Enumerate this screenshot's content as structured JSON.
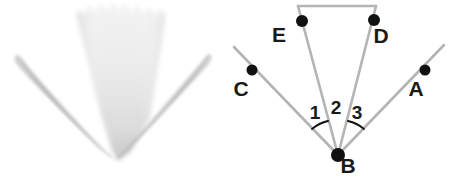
{
  "figure": {
    "background_color": "#ffffff",
    "width": 449,
    "height": 185
  },
  "photo_panel": {
    "name": "blurred-plant-photograph",
    "description": "Out-of-focus grayscale photograph of a pale cone-shaped leaf flanked by two narrow tapered leaves converging at a single point",
    "colors": {
      "cone_light": "#f2f2f2",
      "cone_mid": "#e0e0e0",
      "cone_dark": "#c9c9c9",
      "blade_light": "#d8d8d8",
      "blade_mid": "#bdbdbd",
      "blade_dark": "#a9a9a9"
    },
    "shapes": [
      {
        "id": "center-cone",
        "label": "central cone leaf"
      },
      {
        "id": "left-blade",
        "label": "left tapered leaf"
      },
      {
        "id": "right-blade",
        "label": "right tapered leaf"
      }
    ],
    "convergence_point": {
      "x": 118,
      "y": 160
    }
  },
  "diagram_panel": {
    "name": "angle-diagram",
    "colors": {
      "ray": "#b4b4b4",
      "point": "#111111",
      "label": "#1a1a1a",
      "arc": "#111111"
    },
    "vertex": {
      "name": "B",
      "label": "B",
      "x": 114,
      "y": 155,
      "label_x": 124,
      "label_y": 173,
      "radius": 7
    },
    "points": [
      {
        "name": "C",
        "label": "C",
        "x": 28,
        "y": 70,
        "label_x": 17,
        "label_y": 96,
        "radius": 5.5
      },
      {
        "name": "E",
        "label": "E",
        "x": 78,
        "y": 21,
        "label_x": 55,
        "label_y": 42,
        "radius": 6
      },
      {
        "name": "D",
        "label": "D",
        "x": 150,
        "y": 20,
        "label_x": 157,
        "label_y": 43,
        "radius": 6
      },
      {
        "name": "A",
        "label": "A",
        "x": 201,
        "y": 70,
        "label_x": 192,
        "label_y": 96,
        "radius": 5.5
      }
    ],
    "rays": [
      {
        "id": "ray-BC",
        "from": "B",
        "through": "C",
        "x1": 114,
        "y1": 155,
        "x2": 10,
        "y2": 47
      },
      {
        "id": "ray-BE",
        "from": "B",
        "through": "E",
        "x1": 114,
        "y1": 155,
        "x2": 74,
        "y2": 6
      },
      {
        "id": "ray-BD",
        "from": "B",
        "through": "D",
        "x1": 114,
        "y1": 155,
        "x2": 152,
        "y2": 6
      },
      {
        "id": "ray-BA",
        "from": "B",
        "through": "A",
        "x1": 114,
        "y1": 155,
        "x2": 220,
        "y2": 45
      }
    ],
    "top_segment": {
      "id": "segment-ED-extension",
      "x1": 74,
      "y1": 6,
      "x2": 152,
      "y2": 6
    },
    "angles": [
      {
        "id": "angle-1",
        "label": "1",
        "between": "CBE",
        "label_x": 91,
        "label_y": 119,
        "arc_radius": 36
      },
      {
        "id": "angle-2",
        "label": "2",
        "between": "EBD",
        "label_x": 112,
        "label_y": 114,
        "arc_radius": 0
      },
      {
        "id": "angle-3",
        "label": "3",
        "between": "DBA",
        "label_x": 133,
        "label_y": 119,
        "arc_radius": 36
      }
    ]
  }
}
